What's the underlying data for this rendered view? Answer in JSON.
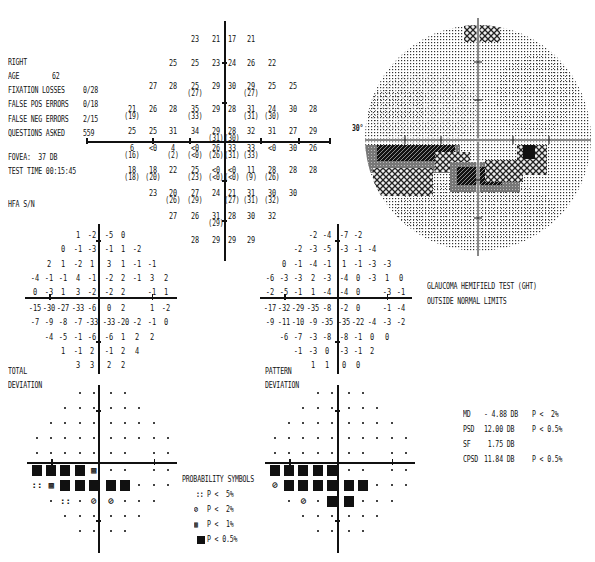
{
  "header": {
    "eye": "RIGHT",
    "rows": [
      {
        "label": "AGE",
        "value": "62"
      },
      {
        "label": "FIXATION LOSSES",
        "value": "0/28"
      },
      {
        "label": "FALSE POS ERRORS",
        "value": "0/18"
      },
      {
        "label": "FALSE NEG ERRORS",
        "value": "2/15"
      },
      {
        "label": "QUESTIONS ASKED",
        "value": "559"
      }
    ],
    "fovea": "FOVEA:  37 DB",
    "test_time": "TEST TIME 00:15:45",
    "strategy": "HFA S/N"
  },
  "threshold_plot": {
    "rows": [
      [
        {
          "c": 4,
          "v": "23"
        },
        {
          "c": 5,
          "v": "21"
        },
        {
          "c": 6,
          "v": "17"
        },
        {
          "c": 7,
          "v": "21"
        }
      ],
      [
        {
          "c": 3,
          "v": "25"
        },
        {
          "c": 4,
          "v": "25"
        },
        {
          "c": 5,
          "v": "23"
        },
        {
          "c": 6,
          "v": "24"
        },
        {
          "c": 7,
          "v": "26"
        },
        {
          "c": 8,
          "v": "22"
        }
      ],
      [
        {
          "c": 2,
          "v": "27"
        },
        {
          "c": 3,
          "v": "28"
        },
        {
          "c": 4,
          "v": "25",
          "r": "(27)"
        },
        {
          "c": 5,
          "v": "29"
        },
        {
          "c": 6,
          "v": "30"
        },
        {
          "c": 7,
          "v": "29",
          "r": "(27)"
        },
        {
          "c": 8,
          "v": "25"
        },
        {
          "c": 9,
          "v": "25"
        }
      ],
      [
        {
          "c": 1,
          "v": "21",
          "r": "(19)"
        },
        {
          "c": 2,
          "v": "26"
        },
        {
          "c": 3,
          "v": "28"
        },
        {
          "c": 4,
          "v": "35",
          "r": "(33)"
        },
        {
          "c": 5,
          "v": "29"
        },
        {
          "c": 6,
          "v": "28"
        },
        {
          "c": 7,
          "v": "31",
          "r": "(31)"
        },
        {
          "c": 8,
          "v": "24",
          "r": "(30)"
        },
        {
          "c": 9,
          "v": "30"
        },
        {
          "c": 10,
          "v": "28"
        }
      ],
      [
        {
          "c": 1,
          "v": "25"
        },
        {
          "c": 2,
          "v": "25"
        },
        {
          "c": 3,
          "v": "31"
        },
        {
          "c": 4,
          "v": "34"
        },
        {
          "c": 5,
          "v": "29",
          "r": "(31)"
        },
        {
          "c": 6,
          "v": "28",
          "r": "(30)"
        },
        {
          "c": 7,
          "v": "32"
        },
        {
          "c": 8,
          "v": "31"
        },
        {
          "c": 9,
          "v": "27"
        },
        {
          "c": 10,
          "v": "29"
        }
      ],
      [
        {
          "c": 1,
          "v": "6",
          "r": "(16)"
        },
        {
          "c": 2,
          "v": "<0"
        },
        {
          "c": 3,
          "v": "4",
          "r": "(2)"
        },
        {
          "c": 4,
          "v": "<0",
          "r": "(<0)"
        },
        {
          "c": 5,
          "v": "26",
          "r": "(26)"
        },
        {
          "c": 6,
          "v": "33",
          "r": "(31)"
        },
        {
          "c": 7,
          "v": "33",
          "r": "(33)"
        },
        {
          "c": 8,
          "v": "<0"
        },
        {
          "c": 9,
          "v": "30"
        },
        {
          "c": 10,
          "v": "26"
        }
      ],
      [
        {
          "c": 1,
          "v": "18",
          "r": "(18)"
        },
        {
          "c": 2,
          "v": "18",
          "r": "(20)"
        },
        {
          "c": 3,
          "v": "22"
        },
        {
          "c": 4,
          "v": "25",
          "r": "(23)"
        },
        {
          "c": 5,
          "v": "<0",
          "r": "(<0)"
        },
        {
          "c": 6,
          "v": "<0",
          "r": "(<0)"
        },
        {
          "c": 7,
          "v": "11",
          "r": "(9)"
        },
        {
          "c": 8,
          "v": "28",
          "r": "(26)"
        },
        {
          "c": 9,
          "v": "28"
        },
        {
          "c": 10,
          "v": "28"
        }
      ],
      [
        {
          "c": 2,
          "v": "23"
        },
        {
          "c": 3,
          "v": "20",
          "r": "(26)"
        },
        {
          "c": 4,
          "v": "27",
          "r": "(29)"
        },
        {
          "c": 5,
          "v": "24"
        },
        {
          "c": 6,
          "v": "21",
          "r": "(27)"
        },
        {
          "c": 7,
          "v": "31",
          "r": "(31)"
        },
        {
          "c": 8,
          "v": "30",
          "r": "(32)"
        },
        {
          "c": 9,
          "v": "30"
        }
      ],
      [
        {
          "c": 3,
          "v": "27"
        },
        {
          "c": 4,
          "v": "26"
        },
        {
          "c": 5,
          "v": "31",
          "r": "(29)"
        },
        {
          "c": 6,
          "v": "28"
        },
        {
          "c": 7,
          "v": "30"
        },
        {
          "c": 8,
          "v": "32"
        }
      ],
      [
        {
          "c": 4,
          "v": "28"
        },
        {
          "c": 5,
          "v": "29"
        },
        {
          "c": 6,
          "v": "29"
        },
        {
          "c": 7,
          "v": "29"
        }
      ]
    ]
  },
  "grayscale": {
    "axis_label": "30°"
  },
  "total_deviation": {
    "label_1": "TOTAL",
    "label_2": "DEVIATION",
    "rows": [
      [
        "",
        "",
        "",
        "1",
        "-2",
        "-5",
        "0",
        "",
        "",
        ""
      ],
      [
        "",
        "",
        "0",
        "-1",
        "-3",
        "-1",
        "1",
        "-2",
        "",
        ""
      ],
      [
        "",
        "2",
        "1",
        "-2",
        "1",
        "3",
        "1",
        "-1",
        "-1",
        ""
      ],
      [
        "-4",
        "-1",
        "-1",
        "4",
        "-1",
        "-2",
        "2",
        "-1",
        "3",
        "2"
      ],
      [
        "0",
        "-3",
        "1",
        "3",
        "-2",
        "-2",
        "2",
        "",
        "-1",
        "1"
      ],
      [
        "-15",
        "-30",
        "-27",
        "-33",
        "-6",
        "0",
        "2",
        "",
        "1",
        "-2"
      ],
      [
        "-7",
        "-9",
        "-8",
        "-7",
        "-33",
        "-33",
        "-20",
        "-2",
        "-1",
        "0"
      ],
      [
        "",
        "-4",
        "-5",
        "-1",
        "-6",
        "-6",
        "1",
        "2",
        "2",
        ""
      ],
      [
        "",
        "",
        "1",
        "-1",
        "2",
        "-1",
        "2",
        "4",
        "",
        ""
      ],
      [
        "",
        "",
        "",
        "3",
        "3",
        "2",
        "2",
        "",
        "",
        ""
      ]
    ]
  },
  "pattern_deviation": {
    "label_1": "PATTERN",
    "label_2": "DEVIATION",
    "rows": [
      [
        "",
        "",
        "",
        "-2",
        "-4",
        "-7",
        "-2",
        "",
        "",
        ""
      ],
      [
        "",
        "",
        "-2",
        "-3",
        "-5",
        "-3",
        "-1",
        "-4",
        "",
        ""
      ],
      [
        "",
        "0",
        "-1",
        "-4",
        "-1",
        "1",
        "-1",
        "-3",
        "-3",
        ""
      ],
      [
        "-6",
        "-3",
        "-3",
        "2",
        "-3",
        "-4",
        "0",
        "-3",
        "1",
        "0"
      ],
      [
        "-2",
        "-5",
        "-1",
        "1",
        "-4",
        "-4",
        "0",
        "",
        "-3",
        "-1"
      ],
      [
        "-17",
        "-32",
        "-29",
        "-35",
        "-8",
        "-2",
        "0",
        "",
        "-1",
        "-4"
      ],
      [
        "-9",
        "-11",
        "-10",
        "-9",
        "-35",
        "-35",
        "-22",
        "-4",
        "-3",
        "-2"
      ],
      [
        "",
        "-6",
        "-7",
        "-3",
        "-8",
        "-8",
        "-1",
        "0",
        "0",
        ""
      ],
      [
        "",
        "",
        "-1",
        "-3",
        "0",
        "-3",
        "-1",
        "2",
        "",
        ""
      ],
      [
        "",
        "",
        "",
        "1",
        "1",
        "0",
        "0",
        "",
        "",
        ""
      ]
    ]
  },
  "td_prob_map": {
    "rows": [
      [
        "",
        "",
        "",
        ".",
        ".",
        ".",
        ".",
        "",
        "",
        ""
      ],
      [
        "",
        "",
        ".",
        ".",
        ".",
        ".",
        ".",
        ".",
        "",
        ""
      ],
      [
        "",
        ".",
        ".",
        ".",
        ".",
        ".",
        ".",
        ".",
        ".",
        ""
      ],
      [
        ".",
        ".",
        ".",
        ".",
        ".",
        ".",
        ".",
        ".",
        ".",
        "."
      ],
      [
        ".",
        ".",
        ".",
        ".",
        ".",
        ".",
        ".",
        "",
        ".",
        "."
      ],
      [
        "B",
        "B",
        "B",
        "B",
        "P1",
        ".",
        ".",
        "",
        ".",
        "."
      ],
      [
        "P5",
        "P1",
        "B",
        "B",
        "B",
        "B",
        "B",
        ".",
        ".",
        "."
      ],
      [
        "",
        ".",
        "P5",
        ".",
        "P2",
        "P2",
        ".",
        ".",
        ".",
        ""
      ],
      [
        "",
        "",
        ".",
        ".",
        ".",
        ".",
        ".",
        ".",
        "",
        ""
      ],
      [
        "",
        "",
        "",
        ".",
        ".",
        ".",
        ".",
        "",
        "",
        ""
      ]
    ]
  },
  "pd_prob_map": {
    "rows": [
      [
        "",
        "",
        "",
        ".",
        ".",
        ".",
        ".",
        "",
        "",
        ""
      ],
      [
        "",
        "",
        ".",
        ".",
        ".",
        ".",
        ".",
        ".",
        "",
        ""
      ],
      [
        "",
        ".",
        ".",
        ".",
        ".",
        ".",
        ".",
        ".",
        ".",
        ""
      ],
      [
        ".",
        ".",
        ".",
        ".",
        ".",
        ".",
        ".",
        ".",
        ".",
        "."
      ],
      [
        ".",
        ".",
        ".",
        ".",
        ".",
        ".",
        ".",
        "",
        ".",
        "."
      ],
      [
        "B",
        "B",
        "B",
        "B",
        "B",
        ".",
        ".",
        "",
        ".",
        "."
      ],
      [
        "P2",
        "B",
        "B",
        "B",
        "B",
        "B",
        "B",
        ".",
        ".",
        "."
      ],
      [
        "",
        ".",
        "P2",
        ".",
        "B",
        "B",
        ".",
        ".",
        ".",
        ""
      ],
      [
        "",
        "",
        ".",
        ".",
        ".",
        ".",
        ".",
        ".",
        "",
        ""
      ],
      [
        "",
        "",
        "",
        ".",
        ".",
        ".",
        ".",
        "",
        "",
        ""
      ]
    ]
  },
  "legend": {
    "title": "PROBABILITY SYMBOLS",
    "items": [
      {
        "sym": "::",
        "label": "P <  5%"
      },
      {
        "sym": "⊘",
        "label": "P <  2%"
      },
      {
        "sym": "▩",
        "label": "P <  1%"
      },
      {
        "sym": "■",
        "label": "P < 0.5%"
      }
    ]
  },
  "ght": {
    "line_1": "GLAUCOMA HEMIFIELD TEST (GHT)",
    "line_2": "OUTSIDE NORMAL LIMITS"
  },
  "indices": [
    {
      "name": "MD",
      "value": "- 4.88 DB",
      "p": "P <  2%"
    },
    {
      "name": "PSD",
      "value": "12.00 DB",
      "p": "P < 0.5%"
    },
    {
      "name": "SF",
      "value": " 1.75 DB",
      "p": ""
    },
    {
      "name": "CPSD",
      "value": "11.84 DB",
      "p": "P < 0.5%"
    }
  ]
}
